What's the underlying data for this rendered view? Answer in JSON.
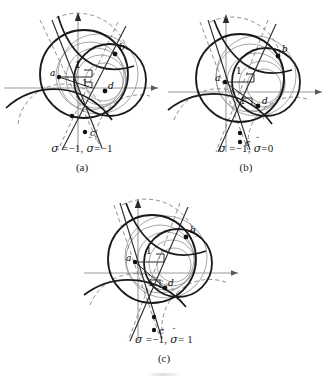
{
  "figure": {
    "background": "#ffffff",
    "colors": {
      "bold_curve": "#1a1a1a",
      "thin_curve": "#8a8a8a",
      "axis": "#9a9a9a",
      "dashed": "#6e6e6e",
      "point": "#111111",
      "text": "#1a1a1a"
    }
  },
  "panels": [
    {
      "id": "a",
      "caption_math": "σ =−1, σ̆ =−1",
      "caption_sigma": "σ",
      "caption_sigma_value": "=−1,",
      "caption_sigma_breve": "σ",
      "caption_breve_mark": "˘",
      "caption_breve_value": "=−1",
      "caption_label": "(a)",
      "points": [
        {
          "name": "a",
          "label": "a",
          "x": 59,
          "y": 77
        },
        {
          "name": "b",
          "label": "b",
          "x": 115,
          "y": 54
        },
        {
          "name": "c",
          "label": "c",
          "x": 85,
          "y": 132
        },
        {
          "name": "d",
          "label": "d",
          "x": 105,
          "y": 91
        }
      ],
      "measure_labels": [
        "1",
        "1"
      ]
    },
    {
      "id": "b",
      "caption_math": "σ =−1, σ̆ =0",
      "caption_sigma": "σ",
      "caption_sigma_value": "=−1,",
      "caption_sigma_breve": "σ",
      "caption_breve_mark": "˘",
      "caption_breve_value": "=0",
      "caption_label": "(b)",
      "points": [
        {
          "name": "a",
          "label": "a",
          "x": 61,
          "y": 82
        },
        {
          "name": "b",
          "label": "b",
          "x": 114,
          "y": 56
        },
        {
          "name": "c",
          "label": "c",
          "x": 76,
          "y": 142
        },
        {
          "name": "c2",
          "label": "",
          "x": 76,
          "y": 133
        },
        {
          "name": "d",
          "label": "d",
          "x": 94,
          "y": 106
        }
      ],
      "measure_labels": [
        "1",
        "1"
      ]
    },
    {
      "id": "c",
      "caption_math": "σ =−1, σ̆ = 1",
      "caption_sigma": "σ",
      "caption_sigma_value": "=−1,",
      "caption_sigma_breve": "σ",
      "caption_breve_mark": "˘",
      "caption_breve_value": "= 1",
      "caption_label": "(c)",
      "points": [
        {
          "name": "a",
          "label": "a",
          "x": 53,
          "y": 71
        },
        {
          "name": "b",
          "label": "b",
          "x": 104,
          "y": 46
        },
        {
          "name": "c",
          "label": "c",
          "x": 72,
          "y": 139
        },
        {
          "name": "c2",
          "label": "",
          "x": 72,
          "y": 126
        },
        {
          "name": "d",
          "label": "d",
          "x": 83,
          "y": 97
        }
      ],
      "measure_labels": [
        "1",
        "1"
      ]
    }
  ]
}
